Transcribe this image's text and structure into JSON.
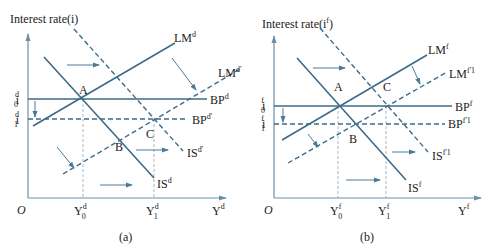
{
  "colors": {
    "curve": "#3d6b8a",
    "axis": "#6d8fa6",
    "guide": "#9db0be",
    "text": "#222222",
    "arrow": "#4a7a9a"
  },
  "panels": [
    {
      "caption": "(a)",
      "y_axis_title": "Interest rate(i)",
      "origin": "O",
      "x_axis_label": {
        "base": "Y",
        "sup": "d"
      },
      "i0": {
        "base": "i",
        "sup": "d",
        "sub": "0"
      },
      "i1": {
        "base": "i",
        "sup": "d",
        "sub": "1"
      },
      "y0": {
        "base": "Y",
        "sup": "d",
        "sub": "0"
      },
      "y1": {
        "base": "Y",
        "sup": "d",
        "sub": "1"
      },
      "curves": {
        "LM": {
          "base": "LM",
          "sup": "d"
        },
        "LM2": {
          "base": "LM",
          "sup": "d'"
        },
        "BP": {
          "base": "BP",
          "sup": "d"
        },
        "BP2": {
          "base": "BP",
          "sup": "d'"
        },
        "IS": {
          "base": "IS",
          "sup": "d"
        },
        "IS2": {
          "base": "IS",
          "sup": "d'"
        }
      },
      "points": {
        "A": "A",
        "B": "B",
        "C": "C"
      }
    },
    {
      "caption": "(b)",
      "y_axis_title": "Interest rate(i",
      "y_axis_title_sup": "f",
      "y_axis_title_end": ")",
      "origin": "O",
      "x_axis_label": {
        "base": "Y",
        "sup": "f"
      },
      "i0": {
        "base": "i",
        "sup": "f",
        "sub": "0"
      },
      "i1": {
        "base": "i",
        "sup": "f",
        "sub": "1"
      },
      "y0": {
        "base": "Y",
        "sup": "f",
        "sub": "0"
      },
      "y1": {
        "base": "Y",
        "sup": "f",
        "sub": "1"
      },
      "curves": {
        "LM": {
          "base": "LM",
          "sup": "f"
        },
        "LM2": {
          "base": "LM",
          "sup": "f'1"
        },
        "BP": {
          "base": "BP",
          "sup": "f"
        },
        "BP2": {
          "base": "BP",
          "sup": "f'1"
        },
        "IS": {
          "base": "IS",
          "sup": "f"
        },
        "IS2": {
          "base": "IS",
          "sup": "f'1"
        }
      },
      "points": {
        "A": "A",
        "B": "B",
        "C": "C"
      }
    }
  ]
}
